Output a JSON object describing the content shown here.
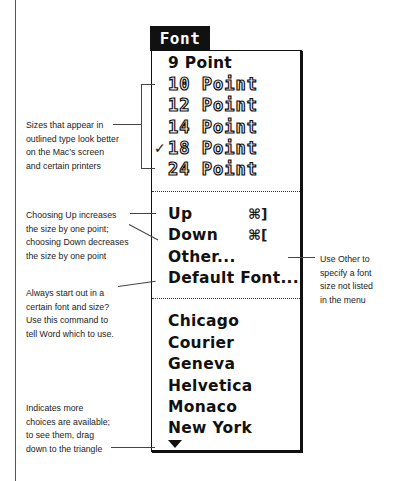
{
  "menu": {
    "title": "Font",
    "size_items": [
      {
        "label": "9 Point",
        "style": "plain",
        "checked": false
      },
      {
        "label": "10 Point",
        "style": "outlined",
        "checked": false
      },
      {
        "label": "12 Point",
        "style": "outlined",
        "checked": false
      },
      {
        "label": "14 Point",
        "style": "outlined",
        "checked": false
      },
      {
        "label": "18 Point",
        "style": "outlined",
        "checked": true
      },
      {
        "label": "24 Point",
        "style": "outlined",
        "checked": false
      }
    ],
    "check_glyph": "✓",
    "command_items": [
      {
        "label": "Up",
        "shortcut": "⌘]"
      },
      {
        "label": "Down",
        "shortcut": "⌘["
      },
      {
        "label": "Other...",
        "shortcut": ""
      },
      {
        "label": "Default Font...",
        "shortcut": ""
      }
    ],
    "font_items": [
      {
        "label": "Chicago"
      },
      {
        "label": "Courier"
      },
      {
        "label": "Geneva"
      },
      {
        "label": "Helvetica"
      },
      {
        "label": "Monaco"
      },
      {
        "label": "New York"
      }
    ],
    "more_indicator": "down-triangle"
  },
  "annotations": {
    "outlined_sizes": "Sizes that appear in\noutlined type look better\non the Mac’s screen\nand certain printers",
    "up_down": "Choosing Up increases\nthe size by one point;\nchoosing Down decreases\nthe size by one point",
    "default_font": "Always start out in a\ncertain font and size?\nUse this command to\ntell Word which to use.",
    "other": "Use Other to\nspecify a font\nsize not listed\nin the menu",
    "more_choices": "Indicates more\nchoices are available;\nto see them, drag\ndown to the triangle"
  }
}
